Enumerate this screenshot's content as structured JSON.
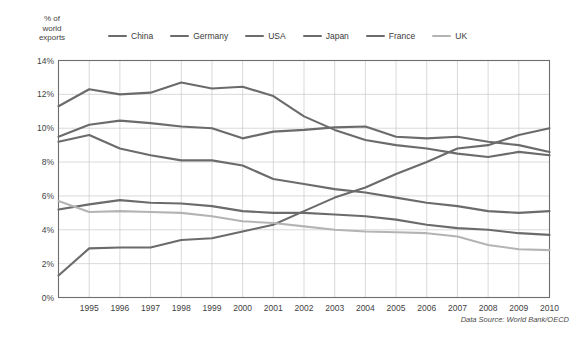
{
  "axis": {
    "ylabel": "% of\nworld\nexports",
    "ytick_labels": [
      "14%",
      "12%",
      "10%",
      "8%",
      "6%",
      "4%",
      "2%",
      "0%"
    ],
    "xtick_labels": [
      "1995",
      "1996",
      "1997",
      "1998",
      "1999",
      "2000",
      "2001",
      "2002",
      "2003",
      "2004",
      "2005",
      "2006",
      "2007",
      "2008",
      "2009",
      "2010"
    ]
  },
  "legend": {
    "items": [
      {
        "label": "China",
        "color": "#6b6b6b"
      },
      {
        "label": "Germany",
        "color": "#6b6b6b"
      },
      {
        "label": "USA",
        "color": "#6b6b6b"
      },
      {
        "label": "Japan",
        "color": "#6b6b6b"
      },
      {
        "label": "France",
        "color": "#6b6b6b"
      },
      {
        "label": "UK",
        "color": "#b4b4b4"
      }
    ]
  },
  "source_note": "Data Source: World Bank/OECD",
  "colors": {
    "grid": "#c9c9c9",
    "frame": "#6d6d6d",
    "line_dark": "#6b6b6b",
    "line_light": "#b4b4b4",
    "background": "#ffffff",
    "text": "#3b3b3b"
  },
  "chart_data": {
    "type": "line",
    "title": "",
    "subtitle": "",
    "xlabel": "",
    "ylabel": "% of world exports",
    "x": [
      1994,
      1995,
      1996,
      1997,
      1998,
      1999,
      2000,
      2001,
      2002,
      2003,
      2004,
      2005,
      2006,
      2007,
      2008,
      2009,
      2010
    ],
    "xlim": [
      1994,
      2010
    ],
    "ylim": [
      0,
      14
    ],
    "ytick_values": [
      0,
      2,
      4,
      6,
      8,
      10,
      12,
      14
    ],
    "grid": true,
    "legend_position": "top",
    "annotations": [
      "Data Source: World Bank/OECD"
    ],
    "series": [
      {
        "name": "China",
        "color": "#6b6b6b",
        "values": [
          1.3,
          2.9,
          2.95,
          2.95,
          3.4,
          3.5,
          3.9,
          4.3,
          5.1,
          5.9,
          6.5,
          7.3,
          8.0,
          8.8,
          9.0,
          9.6,
          10.0
        ]
      },
      {
        "name": "Germany",
        "color": "#6b6b6b",
        "values": [
          9.5,
          10.2,
          10.45,
          10.3,
          10.1,
          10.0,
          9.4,
          9.8,
          9.9,
          10.05,
          10.1,
          9.5,
          9.4,
          9.5,
          9.2,
          9.0,
          8.6
        ]
      },
      {
        "name": "USA",
        "color": "#6b6b6b",
        "values": [
          11.3,
          12.3,
          12.0,
          12.1,
          12.7,
          12.35,
          12.45,
          11.9,
          10.7,
          9.9,
          9.3,
          9.0,
          8.8,
          8.5,
          8.3,
          8.6,
          8.4
        ]
      },
      {
        "name": "Japan",
        "color": "#6b6b6b",
        "values": [
          9.2,
          9.6,
          8.8,
          8.4,
          8.1,
          8.1,
          7.8,
          7.0,
          6.7,
          6.4,
          6.2,
          5.9,
          5.6,
          5.4,
          5.1,
          5.0,
          5.1
        ]
      },
      {
        "name": "France",
        "color": "#6b6b6b",
        "values": [
          5.2,
          5.5,
          5.75,
          5.6,
          5.55,
          5.4,
          5.1,
          5.0,
          5.0,
          4.9,
          4.8,
          4.6,
          4.3,
          4.1,
          4.0,
          3.8,
          3.7
        ]
      },
      {
        "name": "UK",
        "color": "#b4b4b4",
        "values": [
          5.7,
          5.05,
          5.1,
          5.05,
          5.0,
          4.8,
          4.5,
          4.4,
          4.2,
          4.0,
          3.9,
          3.85,
          3.8,
          3.6,
          3.1,
          2.85,
          2.8
        ]
      }
    ]
  }
}
